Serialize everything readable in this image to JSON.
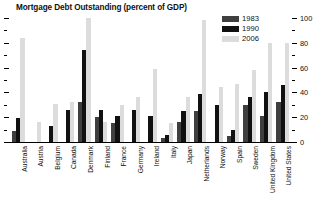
{
  "chart_data": {
    "type": "bar",
    "title": "Mortgage Debt Outstanding (percent of GDP)",
    "xlabel": "",
    "ylabel": "",
    "ylim": [
      0,
      100
    ],
    "yticks": [
      0,
      20,
      40,
      60,
      80,
      100
    ],
    "yticklabels": [
      "0",
      "20",
      "40",
      "60",
      "80",
      "100"
    ],
    "minor_yticks": [
      10,
      30,
      50,
      70,
      90
    ],
    "grid": false,
    "legend_position": "top-right",
    "categories": [
      "Australia",
      "Austria",
      "Belgium",
      "Canada",
      "Denmark",
      "Finland",
      "France",
      "Germany",
      "Ireland",
      "Italy",
      "Japan",
      "Netherlands",
      "Norway",
      "Spain",
      "Sweden",
      "United Kingdom",
      "United States"
    ],
    "series": [
      {
        "name": "1983",
        "color": "#3f3f3f",
        "values": [
          9,
          0,
          0,
          0,
          32,
          20,
          15,
          0,
          0,
          3,
          16,
          25,
          0,
          5,
          30,
          21,
          32
        ]
      },
      {
        "name": "1990",
        "color": "#111111",
        "values": [
          19,
          0,
          13,
          26,
          74,
          26,
          21,
          26,
          21,
          6,
          25,
          39,
          30,
          10,
          36,
          40,
          46
        ]
      },
      {
        "name": "2006",
        "color": "#dcdcdc",
        "values": [
          84,
          16,
          31,
          32,
          100,
          16,
          30,
          36,
          59,
          15,
          36,
          98,
          44,
          47,
          58,
          80,
          80
        ]
      }
    ]
  },
  "legend": {
    "entries": [
      {
        "label": "1983",
        "color": "#3f3f3f"
      },
      {
        "label": "1990",
        "color": "#111111"
      },
      {
        "label": "2006",
        "color": "#dcdcdc"
      }
    ]
  },
  "colors": {
    "background": "#ffffff",
    "axis": "#000000",
    "text": "#111111"
  }
}
